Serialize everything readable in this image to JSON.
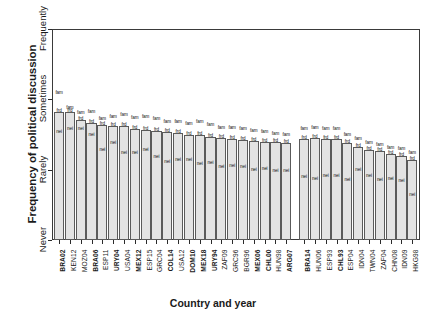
{
  "chart_data": {
    "type": "bar",
    "title": "",
    "xlabel": "Country and year",
    "ylabel": "Frequency of political discussion",
    "ylim": [
      0,
      3
    ],
    "ytick_labels": [
      "Never",
      "Rarely",
      "Sometimes",
      "Frequently"
    ],
    "ytick_values": [
      0,
      1,
      2,
      3
    ],
    "grid": false,
    "legend": "none",
    "marker_labels": [
      "fam",
      "frd",
      "nei"
    ],
    "marker_names": {
      "fam": "family",
      "frd": "friends",
      "nei": "neighbours"
    },
    "group_break_after": "ARG07",
    "categories": [
      "BRA02",
      "KEN12",
      "MOZ04",
      "BRA06",
      "ESP11",
      "URY04",
      "USA04",
      "MEX12",
      "ESP15",
      "GRC04",
      "COL14",
      "USA12",
      "DOM10",
      "MEX18",
      "URY94",
      "ZAF09",
      "GRC96",
      "BGR96",
      "MEX06",
      "CHL00",
      "HUN98",
      "ARG07",
      "BRA14",
      "HUN06",
      "ESP93",
      "CHL93",
      "ESP04",
      "IDN04",
      "TWN04",
      "ZAF04",
      "CHN08",
      "IDN09",
      "HKG98"
    ],
    "categories_bold": [
      "BRA02",
      "BRA06",
      "URY04",
      "MEX12",
      "COL14",
      "DOM10",
      "MEX18",
      "URY94",
      "MEX06",
      "CHL00",
      "ARG07",
      "BRA14",
      "CHL93"
    ],
    "series": [
      {
        "name": "fam",
        "values": [
          2.08,
          1.86,
          1.79,
          1.8,
          1.7,
          1.74,
          1.76,
          1.72,
          1.74,
          1.7,
          1.66,
          1.66,
          1.64,
          1.66,
          1.62,
          1.58,
          1.58,
          1.56,
          1.54,
          1.52,
          1.5,
          1.48,
          1.56,
          1.58,
          1.56,
          1.56,
          1.48,
          1.42,
          1.36,
          1.34,
          1.3,
          1.28,
          1.22
        ]
      },
      {
        "name": "frd",
        "values": [
          1.82,
          1.82,
          1.7,
          1.66,
          1.64,
          1.62,
          1.62,
          1.58,
          1.56,
          1.55,
          1.54,
          1.52,
          1.5,
          1.49,
          1.47,
          1.45,
          1.44,
          1.42,
          1.41,
          1.4,
          1.39,
          1.38,
          1.44,
          1.45,
          1.44,
          1.44,
          1.38,
          1.32,
          1.28,
          1.26,
          1.22,
          1.2,
          1.14
        ]
      },
      {
        "name": "nei",
        "values": [
          1.52,
          1.56,
          1.56,
          1.48,
          1.27,
          1.36,
          1.22,
          1.22,
          1.26,
          1.16,
          1.1,
          1.12,
          1.12,
          1.06,
          1.08,
          1.02,
          1.04,
          1.02,
          0.98,
          1.0,
          0.96,
          0.96,
          0.88,
          0.86,
          0.9,
          0.9,
          0.84,
          0.98,
          0.9,
          0.84,
          0.86,
          0.82,
          0.62
        ]
      }
    ],
    "bar_heights": [
      1.82,
      1.82,
      1.7,
      1.66,
      1.64,
      1.62,
      1.62,
      1.58,
      1.56,
      1.55,
      1.54,
      1.52,
      1.5,
      1.49,
      1.47,
      1.45,
      1.44,
      1.42,
      1.41,
      1.4,
      1.39,
      1.38,
      1.44,
      1.45,
      1.44,
      1.44,
      1.38,
      1.32,
      1.28,
      1.26,
      1.22,
      1.2,
      1.14
    ]
  }
}
